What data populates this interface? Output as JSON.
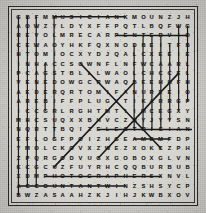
{
  "puzzle": {
    "type": "word-search",
    "rows": 20,
    "cols": 20,
    "title": "",
    "colors": {
      "paper": "#cfcdc8",
      "ink": "#1d1d1d",
      "strike": "#1a1a1a",
      "border": "#2b2b2b"
    },
    "grid": [
      [
        "G",
        "B",
        "F",
        "M",
        "M",
        "U",
        "S",
        "I",
        "C",
        "I",
        "A",
        "N",
        "K",
        "M",
        "O",
        "U",
        "N",
        "Z",
        "J",
        "H"
      ],
      [
        "A",
        "O",
        "W",
        "Z",
        "Y",
        "L",
        "D",
        "Y",
        "X",
        "F",
        "F",
        "P",
        "Q",
        "T",
        "L",
        "B",
        "Q",
        "F",
        "W",
        "G"
      ],
      [
        "R",
        "E",
        "V",
        "O",
        "L",
        "M",
        "R",
        "E",
        "C",
        "A",
        "R",
        "P",
        "E",
        "N",
        "T",
        "E",
        "R",
        "V",
        "I",
        "O"
      ],
      [
        "C",
        "E",
        "W",
        "A",
        "O",
        "Y",
        "H",
        "K",
        "F",
        "Q",
        "X",
        "N",
        "O",
        "D",
        "B",
        "E",
        "I",
        "T",
        "F",
        "B"
      ],
      [
        "H",
        "T",
        "O",
        "M",
        "I",
        "O",
        "C",
        "X",
        "Y",
        "D",
        "J",
        "Q",
        "A",
        "L",
        "C",
        "X",
        "E",
        "E",
        "I",
        "E"
      ],
      [
        "I",
        "N",
        "H",
        "A",
        "C",
        "C",
        "S",
        "O",
        "W",
        "N",
        "F",
        "L",
        "N",
        "F",
        "W",
        "C",
        "A",
        "A",
        "R",
        "L"
      ],
      [
        "P",
        "C",
        "A",
        "G",
        "S",
        "T",
        "B",
        "L",
        "L",
        "L",
        "W",
        "A",
        "O",
        "L",
        "C",
        "H",
        "C",
        "C",
        "E",
        "L"
      ],
      [
        "V",
        "E",
        "N",
        "E",
        "D",
        "O",
        "W",
        "G",
        "C",
        "R",
        "W",
        "A",
        "Q",
        "B",
        "E",
        "E",
        "H",
        "H",
        "F",
        "H"
      ],
      [
        "A",
        "E",
        "D",
        "E",
        "R",
        "Q",
        "R",
        "T",
        "O",
        "M",
        "I",
        "F",
        "A",
        "N",
        "U",
        "R",
        "E",
        "E",
        "I",
        "O"
      ],
      [
        "A",
        "R",
        "E",
        "B",
        "I",
        "F",
        "F",
        "P",
        "L",
        "U",
        "G",
        "Y",
        "T",
        "I",
        "K",
        "A",
        "R",
        "R",
        "G",
        "P"
      ],
      [
        "I",
        "C",
        "C",
        "G",
        "R",
        "L",
        "R",
        "G",
        "H",
        "T",
        "M",
        "T",
        "I",
        "I",
        "M",
        "C",
        "E",
        "G",
        "X",
        "Y"
      ],
      [
        "M",
        "H",
        "C",
        "S",
        "U",
        "Q",
        "X",
        "X",
        "B",
        "H",
        "V",
        "C",
        "Z",
        "N",
        "Y",
        "J",
        "Y",
        "Y",
        "S",
        "N"
      ],
      [
        "N",
        "Q",
        "R",
        "T",
        "T",
        "B",
        "Q",
        "I",
        "Z",
        "E",
        "L",
        "E",
        "C",
        "T",
        "R",
        "I",
        "C",
        "I",
        "A",
        "N"
      ],
      [
        "E",
        "F",
        "L",
        "O",
        "G",
        "F",
        "P",
        "O",
        "I",
        "Z",
        "H",
        "G",
        "E",
        "A",
        "M",
        "E",
        "M",
        "F",
        "D",
        "P"
      ],
      [
        "Y",
        "M",
        "O",
        "L",
        "C",
        "K",
        "O",
        "V",
        "X",
        "Z",
        "W",
        "E",
        "Z",
        "X",
        "O",
        "K",
        "C",
        "Z",
        "P",
        "H"
      ],
      [
        "Z",
        "P",
        "Q",
        "R",
        "G",
        "O",
        "D",
        "V",
        "U",
        "G",
        "X",
        "G",
        "O",
        "B",
        "O",
        "X",
        "G",
        "L",
        "V",
        "N"
      ],
      [
        "K",
        "C",
        "G",
        "C",
        "U",
        "Z",
        "F",
        "U",
        "Y",
        "R",
        "H",
        "C",
        "Q",
        "Q",
        "B",
        "U",
        "R",
        "B",
        "U",
        "B"
      ],
      [
        "X",
        "D",
        "M",
        "P",
        "H",
        "O",
        "T",
        "O",
        "G",
        "R",
        "A",
        "P",
        "H",
        "E",
        "R",
        "S",
        "X",
        "N",
        "V",
        "L"
      ],
      [
        "A",
        "C",
        "C",
        "O",
        "U",
        "N",
        "T",
        "A",
        "N",
        "T",
        "W",
        "I",
        "N",
        "Z",
        "S",
        "H",
        "S",
        "Y",
        "C",
        "P"
      ],
      [
        "B",
        "W",
        "Z",
        "A",
        "S",
        "A",
        "A",
        "H",
        "Z",
        "K",
        "J",
        "I",
        "H",
        "J",
        "K",
        "W",
        "B",
        "X",
        "O",
        "V"
      ]
    ],
    "strikes": [
      {
        "name": "strike-musician-row1",
        "orientation": "horizontal",
        "x1": 4,
        "y1": 0,
        "x2": 12,
        "y2": 0
      },
      {
        "name": "strike-carpenter-row3",
        "orientation": "horizontal",
        "x1": 11,
        "y1": 2,
        "x2": 19,
        "y2": 2
      },
      {
        "name": "strike-electrician-row13",
        "orientation": "horizontal",
        "x1": 9,
        "y1": 12,
        "x2": 20,
        "y2": 12
      },
      {
        "name": "strike-row14-short",
        "orientation": "horizontal",
        "x1": 13,
        "y1": 13,
        "x2": 17,
        "y2": 13
      },
      {
        "name": "strike-photographer-row18",
        "orientation": "horizontal",
        "x1": 3,
        "y1": 17,
        "x2": 16,
        "y2": 17
      },
      {
        "name": "strike-accountant-row19",
        "orientation": "horizontal",
        "x1": 0,
        "y1": 18,
        "x2": 12,
        "y2": 18
      },
      {
        "name": "strike-col1-vertical",
        "orientation": "vertical",
        "x1": 0,
        "y1": 0,
        "x2": 0,
        "y2": 19
      },
      {
        "name": "strike-col2-vertical",
        "orientation": "vertical",
        "x1": 1,
        "y1": 0,
        "x2": 1,
        "y2": 18
      },
      {
        "name": "strike-col3-vertical",
        "orientation": "vertical",
        "x1": 2,
        "y1": 0,
        "x2": 2,
        "y2": 18
      },
      {
        "name": "strike-col4-vertical",
        "orientation": "vertical",
        "x1": 3,
        "y1": 5,
        "x2": 3,
        "y2": 10
      },
      {
        "name": "strike-col5-vertical",
        "orientation": "vertical",
        "x1": 4,
        "y1": 0,
        "x2": 4,
        "y2": 13
      },
      {
        "name": "strike-col14-vertical",
        "orientation": "vertical",
        "x1": 13,
        "y1": 3,
        "x2": 13,
        "y2": 12
      },
      {
        "name": "strike-col15-vertical",
        "orientation": "vertical",
        "x1": 14,
        "y1": 2,
        "x2": 14,
        "y2": 12
      },
      {
        "name": "strike-col16-vertical",
        "orientation": "vertical",
        "x1": 15,
        "y1": 2,
        "x2": 15,
        "y2": 12
      },
      {
        "name": "strike-col17-vertical",
        "orientation": "vertical",
        "x1": 16,
        "y1": 2,
        "x2": 16,
        "y2": 12
      },
      {
        "name": "strike-col18-vertical",
        "orientation": "vertical",
        "x1": 17,
        "y1": 3,
        "x2": 17,
        "y2": 11
      },
      {
        "name": "strike-col19-vertical",
        "orientation": "vertical",
        "x1": 18,
        "y1": 1,
        "x2": 18,
        "y2": 10
      },
      {
        "name": "strike-col20-vertical",
        "orientation": "vertical",
        "x1": 19,
        "y1": 1,
        "x2": 19,
        "y2": 9
      },
      {
        "name": "strike-diagonal-down-right",
        "orientation": "diagonal",
        "x1": 7,
        "y1": 5,
        "x2": 16,
        "y2": 14
      },
      {
        "name": "strike-diagonal-up-right",
        "orientation": "diagonal",
        "x1": 9,
        "y1": 15,
        "x2": 18,
        "y2": 6
      },
      {
        "name": "strike-diagonal-lower-left",
        "orientation": "diagonal",
        "x1": 4,
        "y1": 16,
        "x2": 13,
        "y2": 7
      }
    ]
  }
}
